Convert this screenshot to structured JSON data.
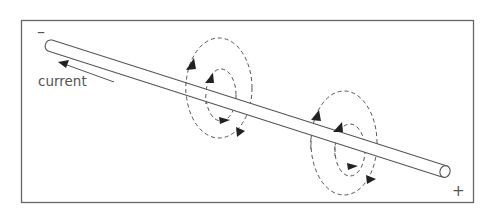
{
  "diagram": {
    "labels": {
      "negative_terminal": "–",
      "positive_terminal": "+",
      "current": "current"
    },
    "colors": {
      "stroke": "#555555",
      "frame": "#666666",
      "background": "#ffffff"
    },
    "elements": {
      "conductor": "straight wire (rod) running diagonally from upper-left (negative) to lower-right (positive)",
      "current_arrow": "arrow pointing toward upper-left along the wire",
      "field_loops": [
        {
          "name": "field-loop-group-1",
          "rings": 2,
          "style": "dashed",
          "direction_markers": 4
        },
        {
          "name": "field-loop-group-2",
          "rings": 2,
          "style": "dashed",
          "direction_markers": 4
        }
      ]
    }
  }
}
